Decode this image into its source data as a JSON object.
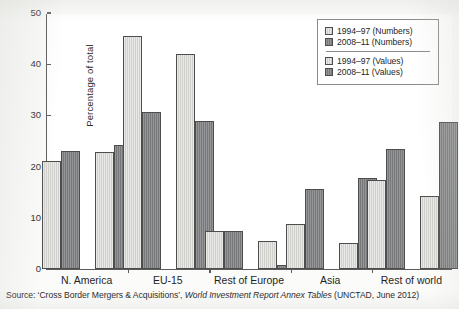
{
  "chart_data": {
    "type": "bar",
    "title": "",
    "xlabel": "",
    "ylabel": "Percentage of total",
    "ylim": [
      0,
      50
    ],
    "yticks": [
      0,
      10,
      20,
      30,
      40,
      50
    ],
    "grid": false,
    "legend_position": "top-right",
    "categories": [
      "N. America",
      "EU-15",
      "Rest of Europe",
      "Asia",
      "Rest of world"
    ],
    "series": [
      {
        "name": "1994–97 (Numbers)",
        "color": "#cfcfcb",
        "values": [
          21.0,
          45.6,
          7.5,
          8.7,
          17.3
        ]
      },
      {
        "name": "2008–11 (Numbers)",
        "color": "#77787a",
        "values": [
          23.0,
          30.6,
          7.5,
          15.6,
          23.5
        ]
      },
      {
        "name": "1994–97 (Values)",
        "color": "#cfcfcb",
        "values": [
          22.9,
          41.9,
          5.4,
          5.1,
          14.2
        ]
      },
      {
        "name": "2008–11 (Values)",
        "color": "#77787a",
        "values": [
          24.2,
          28.9,
          0.7,
          17.7,
          28.8
        ]
      }
    ]
  },
  "legend": {
    "entries": [
      {
        "label": "1994–97 (Numbers)",
        "swatch": "light"
      },
      {
        "label": "2008–11 (Numbers)",
        "swatch": "dark"
      },
      {
        "label": "1994–97 (Values)",
        "swatch": "light"
      },
      {
        "label": "2008–11 (Values)",
        "swatch": "dark"
      }
    ]
  },
  "source": {
    "prefix": "Source: ‘Cross Border Mergers & Acquisitions’, ",
    "italic": "World Investment Report Annex Tables",
    "suffix": " (UNCTAD, June 2012)"
  }
}
